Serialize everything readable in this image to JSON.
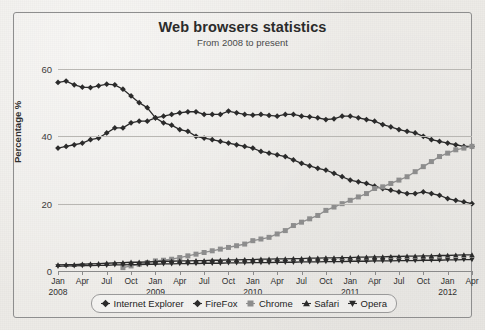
{
  "panel": {
    "title": "Web browsers statistics",
    "subtitle": "From 2008 to present"
  },
  "legend": {
    "entries": [
      {
        "label": "Internet Explorer",
        "marker": "diamond",
        "color": "#2b2b2b"
      },
      {
        "label": "FireFox",
        "marker": "diamond",
        "color": "#2b2b2b"
      },
      {
        "label": "Chrome",
        "marker": "square",
        "color": "#8d8d8d"
      },
      {
        "label": "Safari",
        "marker": "triangle-up",
        "color": "#2b2b2b"
      },
      {
        "label": "Opera",
        "marker": "triangle-down",
        "color": "#2b2b2b"
      }
    ]
  },
  "axes": {
    "y_label": "Percentage %",
    "y_ticks": [
      "0",
      "20",
      "40",
      "60"
    ],
    "x_months": [
      "Jan",
      "Apr",
      "Jul",
      "Oct"
    ],
    "x_years": [
      "2008",
      "2009",
      "2010",
      "2011",
      "2012"
    ]
  },
  "chart_data": {
    "type": "line",
    "title": "Web browsers statistics",
    "subtitle": "From 2008 to present",
    "xlabel": "",
    "ylabel": "Percentage %",
    "ylim": [
      0,
      60
    ],
    "yticks": [
      0,
      20,
      40,
      60
    ],
    "grid": true,
    "legend_position": "bottom",
    "x_start": "Jan 2008",
    "x_end": "Apr 2012",
    "x": [
      "Jan 2008",
      "Feb 2008",
      "Mar 2008",
      "Apr 2008",
      "May 2008",
      "Jun 2008",
      "Jul 2008",
      "Aug 2008",
      "Sep 2008",
      "Oct 2008",
      "Nov 2008",
      "Dec 2008",
      "Jan 2009",
      "Feb 2009",
      "Mar 2009",
      "Apr 2009",
      "May 2009",
      "Jun 2009",
      "Jul 2009",
      "Aug 2009",
      "Sep 2009",
      "Oct 2009",
      "Nov 2009",
      "Dec 2009",
      "Jan 2010",
      "Feb 2010",
      "Mar 2010",
      "Apr 2010",
      "May 2010",
      "Jun 2010",
      "Jul 2010",
      "Aug 2010",
      "Sep 2010",
      "Oct 2010",
      "Nov 2010",
      "Dec 2010",
      "Jan 2011",
      "Feb 2011",
      "Mar 2011",
      "Apr 2011",
      "May 2011",
      "Jun 2011",
      "Jul 2011",
      "Aug 2011",
      "Sep 2011",
      "Oct 2011",
      "Nov 2011",
      "Dec 2011",
      "Jan 2012",
      "Feb 2012",
      "Mar 2012",
      "Apr 2012"
    ],
    "series": [
      {
        "name": "Internet Explorer",
        "marker": "diamond",
        "color": "#2b2b2b",
        "values": [
          56.0,
          56.4,
          55.3,
          54.6,
          54.5,
          55.0,
          55.5,
          55.3,
          54.0,
          52.0,
          50.0,
          48.5,
          45.5,
          44.0,
          43.3,
          42.0,
          41.5,
          40.0,
          39.5,
          39.0,
          38.5,
          38.0,
          37.5,
          37.0,
          36.5,
          35.5,
          35.0,
          34.5,
          34.0,
          33.0,
          32.0,
          31.2,
          30.5,
          30.0,
          29.0,
          28.0,
          27.0,
          26.5,
          26.0,
          25.2,
          24.5,
          24.0,
          23.5,
          23.0,
          23.0,
          23.5,
          23.0,
          22.5,
          21.5,
          21.0,
          20.5,
          20.0
        ]
      },
      {
        "name": "FireFox",
        "marker": "diamond",
        "color": "#2b2b2b",
        "values": [
          36.5,
          37.0,
          37.5,
          38.0,
          39.0,
          39.5,
          41.0,
          42.5,
          42.5,
          44.0,
          44.5,
          44.5,
          45.5,
          46.0,
          46.5,
          47.0,
          47.3,
          47.3,
          46.5,
          46.5,
          46.5,
          47.5,
          47.0,
          46.5,
          46.3,
          46.5,
          46.2,
          46.0,
          46.5,
          46.5,
          46.0,
          45.8,
          45.5,
          45.0,
          45.2,
          46.0,
          46.0,
          45.5,
          45.0,
          44.5,
          43.5,
          42.8,
          42.0,
          41.5,
          41.0,
          40.0,
          39.0,
          38.5,
          38.0,
          37.5,
          37.0,
          37.0
        ]
      },
      {
        "name": "Chrome",
        "marker": "square",
        "color": "#8d8d8d",
        "values": [
          0.0,
          0.0,
          0.0,
          0.0,
          0.0,
          0.0,
          0.0,
          0.0,
          1.0,
          1.5,
          2.0,
          2.5,
          3.0,
          3.2,
          3.5,
          4.0,
          4.5,
          5.0,
          5.5,
          6.0,
          6.5,
          7.0,
          7.5,
          8.0,
          9.0,
          9.5,
          10.0,
          11.0,
          12.0,
          13.5,
          14.5,
          15.5,
          16.5,
          18.0,
          19.0,
          20.0,
          21.0,
          22.0,
          23.0,
          24.5,
          25.0,
          26.0,
          27.0,
          28.0,
          29.5,
          31.0,
          32.5,
          34.0,
          35.0,
          36.0,
          36.5,
          37.0
        ]
      },
      {
        "name": "Safari",
        "marker": "triangle-up",
        "color": "#2b2b2b",
        "values": [
          1.8,
          1.9,
          1.9,
          2.0,
          2.1,
          2.2,
          2.3,
          2.4,
          2.5,
          2.6,
          2.6,
          2.7,
          2.8,
          2.9,
          2.9,
          3.0,
          3.0,
          3.1,
          3.1,
          3.2,
          3.2,
          3.3,
          3.3,
          3.4,
          3.4,
          3.5,
          3.5,
          3.6,
          3.6,
          3.7,
          3.7,
          3.8,
          3.8,
          3.9,
          3.9,
          4.0,
          4.0,
          4.1,
          4.1,
          4.2,
          4.2,
          4.3,
          4.3,
          4.4,
          4.4,
          4.5,
          4.5,
          4.6,
          4.6,
          4.7,
          4.8,
          4.8
        ]
      },
      {
        "name": "Opera",
        "marker": "triangle-down",
        "color": "#2b2b2b",
        "values": [
          1.4,
          1.5,
          1.5,
          1.6,
          1.6,
          1.7,
          1.7,
          1.8,
          1.8,
          1.9,
          1.9,
          2.0,
          2.0,
          2.1,
          2.1,
          2.2,
          2.2,
          2.2,
          2.3,
          2.3,
          2.3,
          2.4,
          2.4,
          2.4,
          2.5,
          2.5,
          2.5,
          2.6,
          2.6,
          2.6,
          2.7,
          2.7,
          2.7,
          2.8,
          2.8,
          2.8,
          2.9,
          2.9,
          2.9,
          3.0,
          3.0,
          3.0,
          3.1,
          3.1,
          3.1,
          3.2,
          3.2,
          3.2,
          3.3,
          3.3,
          3.4,
          3.4
        ]
      }
    ]
  }
}
